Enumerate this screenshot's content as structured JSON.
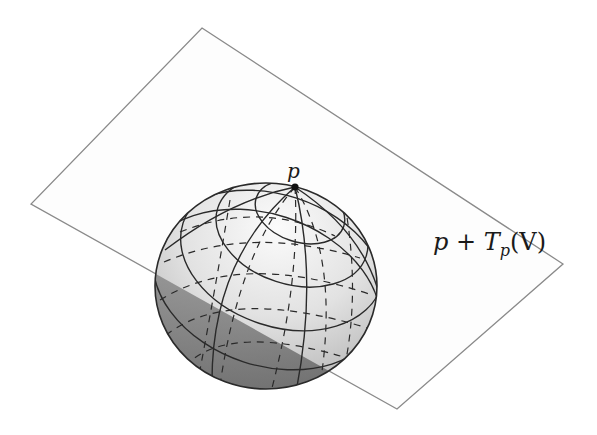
{
  "figure": {
    "type": "sphere-with-tangent-plane",
    "point_label": "p",
    "plane_label": {
      "prefix": "p + T",
      "subscript": "p",
      "suffix": "(V)"
    },
    "colors": {
      "background": "#ffffff",
      "plane_edge": "#8a8a8a",
      "plane_fill": "#fdfdfd",
      "grid_line": "#2a2a2a",
      "point": "#111111",
      "sphere_light": "#f4f4f4",
      "sphere_mid": "#c8c8c8",
      "sphere_dark": "#6e6e6e"
    },
    "plane_corners": [
      [
        202,
        28
      ],
      [
        563,
        264
      ],
      [
        397,
        409
      ],
      [
        31,
        204
      ]
    ],
    "sphere": {
      "cx": 266,
      "cy": 286,
      "rx": 111,
      "ry": 103
    },
    "point": {
      "x": 295,
      "y": 187
    }
  }
}
